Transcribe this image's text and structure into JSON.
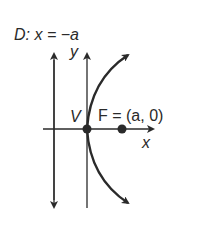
{
  "diagram": {
    "directrix_label": "D: x = −a",
    "y_axis_label": "y",
    "x_axis_label": "x",
    "vertex_label": "V",
    "focus_label": "F = (a, 0)",
    "colors": {
      "stroke": "#2a2a2a",
      "background": "#ffffff"
    }
  }
}
